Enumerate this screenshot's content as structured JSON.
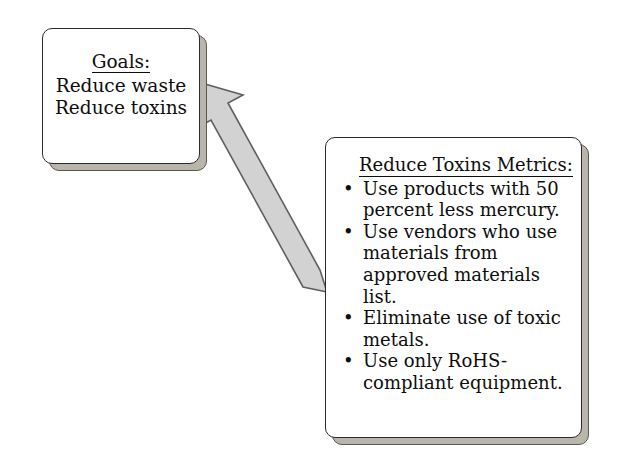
{
  "diagram": {
    "background_color": "#ffffff",
    "nodes": {
      "goals": {
        "title": "Goals:",
        "lines": [
          "Reduce waste",
          "Reduce toxins"
        ],
        "border_color": "#2b2b2b",
        "fill_color": "#ffffff",
        "shadow_color": "#b9b5ad"
      },
      "metrics": {
        "title": "Reduce Toxins Metrics:",
        "bullet_glyph": "•",
        "bullets": [
          "Use products with 50 percent less mercury.",
          "Use vendors who use materials from approved materials list.",
          "Eliminate use of toxic metals.",
          "Use only RoHS-compliant equipment."
        ],
        "border_color": "#2b2b2b",
        "fill_color": "#ffffff",
        "shadow_color": "#b9b5ad"
      }
    },
    "connector": {
      "kind": "block-arrow",
      "from": "metrics",
      "to": "goals",
      "direction": "up-left",
      "fill_color": "#d2d2d2",
      "outline_color": "#5f5f5f"
    }
  }
}
